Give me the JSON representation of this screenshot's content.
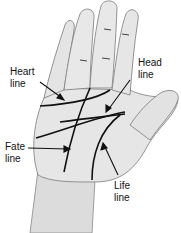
{
  "diagram": {
    "colors": {
      "skin": "#e6e6e6",
      "shade": "#c9c9c9",
      "outline": "#7a7a7a",
      "line": "#111111"
    },
    "labels": [
      {
        "id": "heart",
        "line1": "Heart",
        "line2": "line"
      },
      {
        "id": "head",
        "line1": "Head",
        "line2": "line"
      },
      {
        "id": "fate",
        "line1": "Fate",
        "line2": "line"
      },
      {
        "id": "life",
        "line1": "Life",
        "line2": "line"
      }
    ]
  }
}
